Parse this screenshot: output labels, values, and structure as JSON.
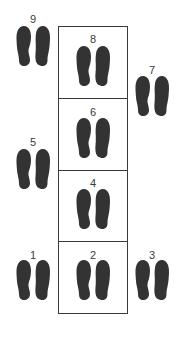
{
  "diagram": {
    "title": "",
    "footprint_color": "#333333",
    "line_color": "#3a3a3a",
    "center_column_cells": [
      {
        "step": "8"
      },
      {
        "step": "6"
      },
      {
        "step": "4"
      },
      {
        "step": "2"
      }
    ],
    "steps": [
      {
        "id": "9",
        "label": "9",
        "column": "left",
        "row": 1
      },
      {
        "id": "8",
        "label": "8",
        "column": "center",
        "row": 1
      },
      {
        "id": "7",
        "label": "7",
        "column": "right",
        "row": 2
      },
      {
        "id": "6",
        "label": "6",
        "column": "center",
        "row": 2
      },
      {
        "id": "5",
        "label": "5",
        "column": "left",
        "row": 3
      },
      {
        "id": "4",
        "label": "4",
        "column": "center",
        "row": 3
      },
      {
        "id": "1",
        "label": "1",
        "column": "left",
        "row": 4
      },
      {
        "id": "2",
        "label": "2",
        "column": "center",
        "row": 4
      },
      {
        "id": "3",
        "label": "3",
        "column": "right",
        "row": 4
      }
    ]
  }
}
